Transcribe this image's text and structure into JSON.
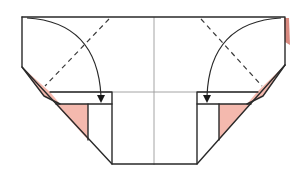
{
  "diagram": {
    "colors": {
      "paper": "#ffffff",
      "line": "#2a2a2a",
      "crease": "#9a9a9a",
      "reverse_side": "#f4b9ae"
    },
    "elements": [
      {
        "name": "paper-outline",
        "type": "polygon"
      },
      {
        "name": "center-crease",
        "type": "line"
      },
      {
        "name": "horizontal-crease",
        "type": "line"
      },
      {
        "name": "left-valley-fold-dashed",
        "type": "dashed-line"
      },
      {
        "name": "right-valley-fold-dashed",
        "type": "dashed-line"
      },
      {
        "name": "left-fold-arrow",
        "type": "arrow",
        "direction": "down"
      },
      {
        "name": "right-fold-arrow",
        "type": "arrow",
        "direction": "down"
      },
      {
        "name": "left-pink-flap",
        "type": "shape"
      },
      {
        "name": "right-pink-flap",
        "type": "shape"
      },
      {
        "name": "left-band",
        "type": "rect"
      },
      {
        "name": "right-band",
        "type": "rect"
      }
    ]
  }
}
